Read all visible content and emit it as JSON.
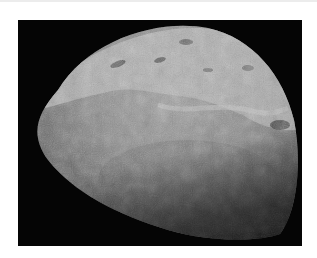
{
  "image": {
    "subject": "moon-surface",
    "description": "Grayscale photograph of a moon (Triton-like) partially lit, with bright mottled polar terrain at top and smoother gray plains below, on a black background",
    "colors": {
      "page_background": "#ffffff",
      "frame_background": "#050505",
      "surface_light": "#b8b8b8",
      "surface_mid": "#8a8a8a",
      "surface_dark": "#3a3a3a"
    }
  }
}
